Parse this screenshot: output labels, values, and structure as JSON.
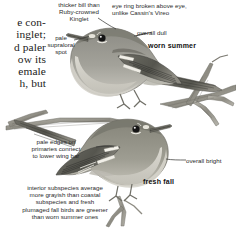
{
  "page": {
    "kind": "field-guide-plate",
    "background": "#ffffff"
  },
  "book_column": {
    "lines": [
      "e con-",
      "inglet;",
      "d paler",
      "ow its",
      "emale",
      "h, but"
    ]
  },
  "annotations": [
    {
      "id": "bill-note",
      "text": "thicker bill than\nRuby-crowned\nKinglet",
      "style": "regular",
      "align": "center"
    },
    {
      "id": "eyering-note",
      "text": "eye ring broken above eye,\nunlike Cassin's Vireo",
      "style": "regular",
      "align": "left"
    },
    {
      "id": "supraloral-note",
      "text": "pale\nsupraloral\nspot",
      "style": "regular",
      "align": "center"
    },
    {
      "id": "overall-dull-note",
      "text": "overall dull",
      "style": "regular",
      "align": "left"
    },
    {
      "id": "worn-summer-label",
      "text": "worn summer",
      "style": "bold",
      "align": "left"
    },
    {
      "id": "primaries-note",
      "text": "pale edges on\nprimaries connect\nto lower wing bar",
      "style": "regular",
      "align": "center"
    },
    {
      "id": "overall-bright-note",
      "text": "overall bright",
      "style": "regular",
      "align": "left"
    },
    {
      "id": "fresh-fall-label",
      "text": "fresh fall",
      "style": "bold",
      "align": "left"
    },
    {
      "id": "subspecies-note",
      "text": "interior subspecies average\nmore grayish than coastal\nsubspecies and fresh\nplumaged fall birds are greener\nthan worn summer ones",
      "style": "regular",
      "align": "center"
    }
  ],
  "figures": [
    {
      "id": "upper-bird",
      "label": "worn summer",
      "facing": "left",
      "perched_on": "branch"
    },
    {
      "id": "lower-bird",
      "label": "fresh fall",
      "facing": "right",
      "perched_on": "branch"
    }
  ],
  "colors": {
    "text": "#2a2a2a",
    "bold_text": "#101010",
    "body_text": "#1b1b1b",
    "plumage_back": "#8e8e88",
    "plumage_belly": "#d8d6cf",
    "plumage_dark": "#4a4a46",
    "branch": "#9a9890",
    "eye": "#111111",
    "background": "#ffffff"
  }
}
